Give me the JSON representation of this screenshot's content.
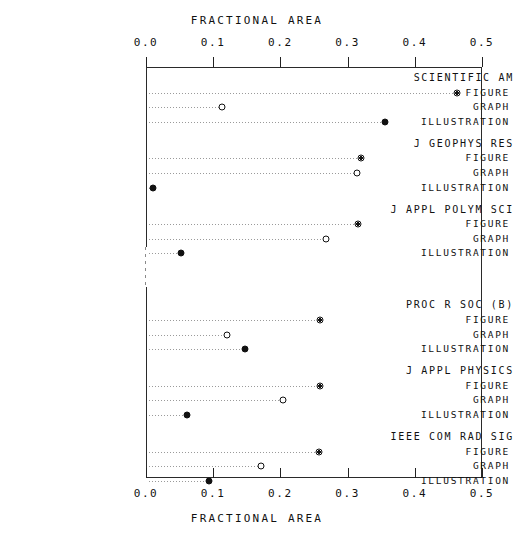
{
  "chart_data": {
    "type": "scatter",
    "title": "FRACTIONAL AREA",
    "xlabel": "FRACTIONAL AREA",
    "xlabel_top": "FRACTIONAL AREA",
    "ylabel": "",
    "xlim": [
      0.0,
      0.5
    ],
    "xticks": [
      0.0,
      0.1,
      0.2,
      0.3,
      0.4,
      0.5
    ],
    "xticklabels": [
      "0.0",
      "0.1",
      "0.2",
      "0.3",
      "0.4",
      "0.5"
    ],
    "grid": false,
    "legend": "none",
    "axis_break": true,
    "series_names": [
      "FIGURE",
      "GRAPH",
      "ILLUSTRATION"
    ],
    "marker_styles": {
      "FIGURE": "bullseye",
      "GRAPH": "open",
      "ILLUSTRATION": "filled"
    },
    "groups": [
      {
        "name": "SCIENTIFIC AM",
        "rows": [
          {
            "label": "FIGURE",
            "value": 0.463,
            "marker": "bullseye"
          },
          {
            "label": "GRAPH",
            "value": 0.113,
            "marker": "open"
          },
          {
            "label": "ILLUSTRATION",
            "value": 0.356,
            "marker": "filled"
          }
        ]
      },
      {
        "name": "J GEOPHYS RES",
        "rows": [
          {
            "label": "FIGURE",
            "value": 0.32,
            "marker": "bullseye"
          },
          {
            "label": "GRAPH",
            "value": 0.314,
            "marker": "open"
          },
          {
            "label": "ILLUSTRATION",
            "value": 0.01,
            "marker": "filled"
          }
        ]
      },
      {
        "name": "J APPL POLYM SCI",
        "rows": [
          {
            "label": "FIGURE",
            "value": 0.316,
            "marker": "bullseye"
          },
          {
            "label": "GRAPH",
            "value": 0.268,
            "marker": "open"
          },
          {
            "label": "ILLUSTRATION",
            "value": 0.052,
            "marker": "filled"
          }
        ]
      },
      {
        "name": "PROC R SOC (B)",
        "rows": [
          {
            "label": "FIGURE",
            "value": 0.259,
            "marker": "bullseye"
          },
          {
            "label": "GRAPH",
            "value": 0.121,
            "marker": "open"
          },
          {
            "label": "ILLUSTRATION",
            "value": 0.147,
            "marker": "filled"
          }
        ]
      },
      {
        "name": "J APPL PHYSICS",
        "rows": [
          {
            "label": "FIGURE",
            "value": 0.259,
            "marker": "bullseye"
          },
          {
            "label": "GRAPH",
            "value": 0.204,
            "marker": "open"
          },
          {
            "label": "ILLUSTRATION",
            "value": 0.061,
            "marker": "filled"
          }
        ]
      },
      {
        "name": "IEEE COM RAD SIG",
        "rows": [
          {
            "label": "FIGURE",
            "value": 0.257,
            "marker": "bullseye"
          },
          {
            "label": "GRAPH",
            "value": 0.171,
            "marker": "open"
          },
          {
            "label": "ILLUSTRATION",
            "value": 0.094,
            "marker": "filled"
          }
        ]
      }
    ]
  },
  "colors": {
    "ink": "#111111",
    "frame": "#2a2a2a",
    "leader": "#9a9a9a",
    "background": "#ffffff"
  }
}
